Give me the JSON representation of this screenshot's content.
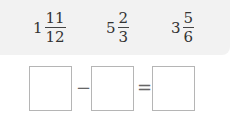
{
  "numbers": [
    {
      "whole": "1",
      "numerator": "11",
      "denominator": "12"
    },
    {
      "whole": "5",
      "numerator": "2",
      "denominator": "3"
    },
    {
      "whole": "3",
      "numerator": "5",
      "denominator": "6"
    }
  ],
  "equation": {
    "operator": "−",
    "equals": "=",
    "boxes": [
      "",
      "",
      ""
    ]
  }
}
